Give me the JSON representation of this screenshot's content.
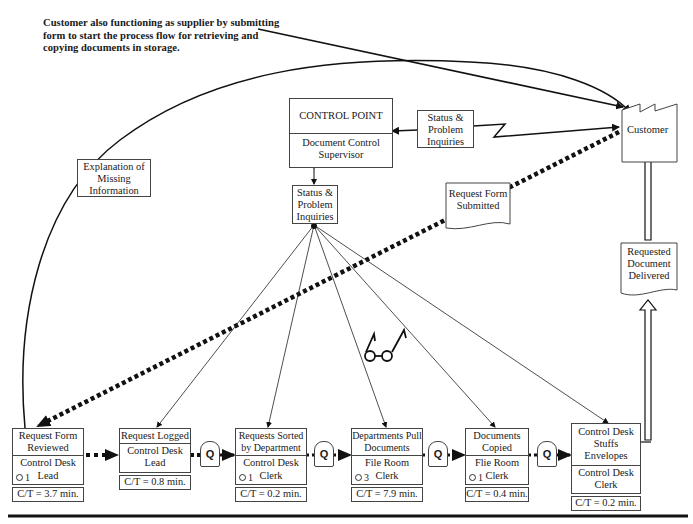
{
  "note": {
    "text": "Customer also functioning as supplier by submitting form to start the process flow for retrieving and copying documents in storage."
  },
  "control_point": {
    "title": "CONTROL POINT",
    "role": "Document Control Supervisor"
  },
  "info_boxes": {
    "status_right": "Status & Problem Inquiries",
    "status_center": "Status & Problem Inquiries",
    "explanation": "Explanation of Missing Information"
  },
  "customer": {
    "label": "Customer"
  },
  "documents": {
    "request_form": "Request Form Submitted",
    "delivered": "Requested Document Delivered"
  },
  "queue_label": "Q",
  "go_see_icon": "eyeglasses-icon",
  "processes": [
    {
      "name": "Request Form Reviewed",
      "role": "Control Desk Lead",
      "operators": "1",
      "ct": "C/T = 3.7 min."
    },
    {
      "name": "Request Logged",
      "role": "Control Desk Lead",
      "operators": "",
      "ct": "C/T = 0.8 min."
    },
    {
      "name": "Requests Sorted by Department",
      "role": "Control Desk Clerk",
      "operators": "1",
      "ct": "C/T = 0.2 min."
    },
    {
      "name": "Departments Pull Documents",
      "role": "File Room Clerk",
      "operators": "3",
      "ct": "C/T = 7.9 min."
    },
    {
      "name": "Documents Copied",
      "role": "Flie Room Clerk",
      "operators": "1",
      "ct": "C/T = 0.4 min."
    },
    {
      "name": "Control Desk Stuffs Envelopes",
      "role": "Control Desk Clerk",
      "operators": "",
      "ct": "C/T = 0.2 min."
    }
  ],
  "colors": {
    "line": "#111111",
    "box_border": "#444444",
    "background": "#ffffff"
  }
}
